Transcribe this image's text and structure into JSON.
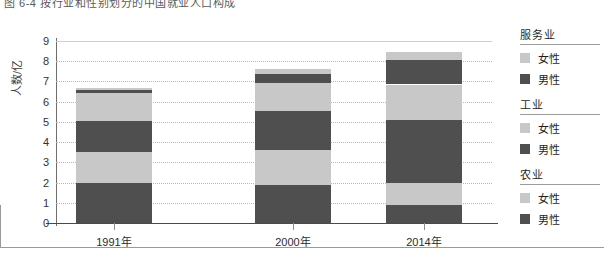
{
  "figure": {
    "caption": "图 6-4   按行业和性别划分的中国就业人口构成"
  },
  "legend": {
    "position": "right",
    "groups": [
      {
        "title": "服务业",
        "items": [
          {
            "label": "女性",
            "color": "#c8c8c8"
          },
          {
            "label": "男性",
            "color": "#4f4f4f"
          }
        ]
      },
      {
        "title": "工业",
        "items": [
          {
            "label": "女性",
            "color": "#c8c8c8"
          },
          {
            "label": "男性",
            "color": "#4f4f4f"
          }
        ]
      },
      {
        "title": "农业",
        "items": [
          {
            "label": "女性",
            "color": "#c8c8c8"
          },
          {
            "label": "男性",
            "color": "#4f4f4f"
          }
        ]
      }
    ]
  },
  "colors": {
    "female": "#c8c8c8",
    "male": "#4f4f4f",
    "grid": "#b9b9b9",
    "axis": "#4a4a4a",
    "text": "#2b2b2b"
  },
  "chart_data": {
    "type": "bar",
    "stacked": true,
    "title": "图 6-4   按行业和性别划分的中国就业人口构成",
    "xlabel": "",
    "ylabel": "人数/亿",
    "ylim": [
      0,
      9
    ],
    "yticks": [
      0,
      1,
      2,
      3,
      4,
      5,
      6,
      7,
      8,
      9
    ],
    "ytick_labels": [
      "0",
      "1",
      "2",
      "3",
      "4",
      "5",
      "6",
      "7",
      "8",
      "9"
    ],
    "grid": true,
    "categories": [
      "1991年",
      "2000年",
      "2014年"
    ],
    "series": [
      {
        "name": "农业 男性",
        "values": [
          2.0,
          1.9,
          0.9
        ]
      },
      {
        "name": "农业 女性",
        "values": [
          1.5,
          1.7,
          1.1
        ]
      },
      {
        "name": "工业 男性",
        "values": [
          1.55,
          1.95,
          3.1
        ]
      },
      {
        "name": "工业 女性",
        "values": [
          1.4,
          1.35,
          1.75
        ]
      },
      {
        "name": "服务业 男性",
        "values": [
          0.15,
          0.45,
          1.2
        ]
      },
      {
        "name": "服务业 女性",
        "values": [
          0.1,
          0.25,
          0.4
        ]
      }
    ],
    "totals": [
      6.7,
      7.6,
      8.45
    ]
  }
}
